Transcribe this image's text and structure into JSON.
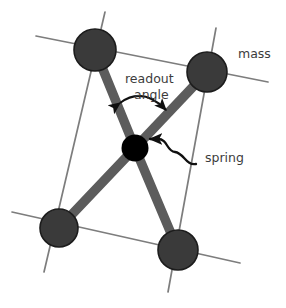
{
  "figure": {
    "background_color": "#ffffff"
  },
  "colors": {
    "mass_fill": "#3a3a3a",
    "mass_stroke": "#1c1c1c",
    "spoke": "#5c5c5c",
    "frame_line": "#7d7d7d",
    "spring_node": "#000000",
    "text": "#3c3c3c",
    "arrow": "#101010"
  },
  "labels": {
    "mass": "mass",
    "readout_line1": "readout",
    "readout_line2": "angle",
    "spring": "spring"
  },
  "nodes": {
    "mass_top_left": {
      "name": "mass",
      "cx": 95,
      "cy": 50,
      "r": 21
    },
    "mass_top_right": {
      "name": "mass",
      "cx": 207,
      "cy": 72,
      "r": 20
    },
    "mass_bottom_left": {
      "name": "mass",
      "cx": 59,
      "cy": 228,
      "r": 19
    },
    "mass_bottom_right": {
      "name": "mass",
      "cx": 178,
      "cy": 250,
      "r": 20
    },
    "spring_center": {
      "name": "spring",
      "cx": 135,
      "cy": 148,
      "r": 13
    }
  },
  "frame_lines": [
    {
      "name": "top-edge",
      "x1": 36,
      "y1": 36,
      "x2": 268,
      "y2": 82
    },
    {
      "name": "bottom-edge",
      "x1": 12,
      "y1": 212,
      "x2": 240,
      "y2": 263
    },
    {
      "name": "left-edge",
      "x1": 105,
      "y1": 12,
      "x2": 44,
      "y2": 272
    },
    {
      "name": "right-edge",
      "x1": 216,
      "y1": 28,
      "x2": 168,
      "y2": 292
    }
  ],
  "spokes": [
    {
      "name": "spoke-top-left",
      "from": "mass_top_left",
      "to": "spring_center"
    },
    {
      "name": "spoke-top-right",
      "from": "mass_top_right",
      "to": "spring_center"
    },
    {
      "name": "spoke-bottom-left",
      "from": "mass_bottom_left",
      "to": "spring_center"
    },
    {
      "name": "spoke-bottom-right",
      "from": "mass_bottom_right",
      "to": "spring_center"
    }
  ],
  "annotations": {
    "readout_angle_arrow": {
      "name": "double-headed-curved-arrow",
      "start": [
        118,
        101
      ],
      "end": [
        168,
        112
      ],
      "double_headed": true
    },
    "spring_arrow": {
      "name": "wavy-pointer-arrow",
      "start": [
        186,
        161
      ],
      "end": [
        148,
        140
      ],
      "double_headed": false
    }
  },
  "label_positions": {
    "mass": [
      240,
      53
    ],
    "readout_line1": [
      126,
      78
    ],
    "readout_line2": [
      134,
      94
    ],
    "spring": [
      193,
      157
    ]
  }
}
